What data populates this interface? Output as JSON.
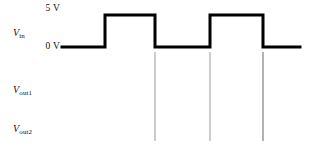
{
  "figure": {
    "type": "timing-diagram",
    "width": 314,
    "height": 152,
    "background_color": "#ffffff"
  },
  "labels": {
    "level_high": "5 V",
    "level_low": "0 V",
    "signal_in_var": "V",
    "signal_in_sub": "in",
    "signal_out1_var": "V",
    "signal_out1_sub": "out1",
    "signal_out2_var": "V",
    "signal_out2_sub": "out2"
  },
  "colors": {
    "trace": "#000000",
    "guide_line": "#999999",
    "text": "#111111",
    "background": "#ffffff"
  },
  "chart_data": {
    "type": "line",
    "title": "",
    "xlabel": "",
    "ylabel": "",
    "subtype": "digital-timing-waveform",
    "grid": false,
    "legend": false,
    "y_tick_labels": [
      "5 V",
      "0 V"
    ],
    "ylim": [
      0,
      5
    ],
    "traces": [
      {
        "name": "V_in",
        "label": "Vin",
        "description": "Input square wave, two full high pulses, 50% duty cycle",
        "levels_volts": [
          0,
          5
        ],
        "x": [
          62,
          105,
          105,
          155,
          155,
          210,
          210,
          263,
          263,
          300
        ],
        "y": [
          0,
          0,
          5,
          5,
          0,
          0,
          5,
          5,
          0,
          0
        ],
        "drawn": true
      },
      {
        "name": "V_out1",
        "label": "Vout1",
        "description": "Output waveform row left blank for the student to draw",
        "drawn": false
      },
      {
        "name": "V_out2",
        "label": "Vout2",
        "description": "Output waveform row left blank for the student to draw",
        "drawn": false
      }
    ],
    "guide_lines": {
      "orientation": "vertical",
      "x_positions": [
        105,
        155,
        210,
        263
      ],
      "y_top": 52,
      "y_bottom": 141,
      "color": "#999999",
      "aligned_with": "V_in transition edges"
    }
  }
}
